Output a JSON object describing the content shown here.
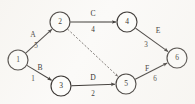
{
  "figure": {
    "kind": "directed-weighted-graph",
    "background_color": "#fbfaf8",
    "stroke_color": "#3a3633",
    "dashed_stroke_color": "#6b6662"
  },
  "nodes": [
    {
      "id": "1",
      "label": "1",
      "cx": 18,
      "cy": 60,
      "r": 10
    },
    {
      "id": "2",
      "label": "2",
      "cx": 60,
      "cy": 22,
      "r": 10
    },
    {
      "id": "3",
      "label": "3",
      "cx": 61,
      "cy": 86,
      "r": 10
    },
    {
      "id": "4",
      "label": "4",
      "cx": 127,
      "cy": 22,
      "r": 10
    },
    {
      "id": "5",
      "label": "5",
      "cx": 126,
      "cy": 84,
      "r": 10
    },
    {
      "id": "6",
      "label": "6",
      "cx": 177,
      "cy": 58,
      "r": 10
    }
  ],
  "edges": [
    {
      "id": "A",
      "from": "1",
      "to": "2",
      "name": "A",
      "weight": "5",
      "style": "solid",
      "name_x": 33,
      "name_y": 35,
      "weight_x": 36,
      "weight_y": 46
    },
    {
      "id": "B",
      "from": "1",
      "to": "3",
      "name": "B",
      "weight": "1",
      "style": "solid",
      "name_x": 40,
      "name_y": 68,
      "weight_x": 33,
      "weight_y": 79
    },
    {
      "id": "C",
      "from": "2",
      "to": "4",
      "name": "C",
      "weight": "4",
      "style": "solid",
      "name_x": 93,
      "name_y": 14,
      "weight_x": 93,
      "weight_y": 30
    },
    {
      "id": "D",
      "from": "3",
      "to": "5",
      "name": "D",
      "weight": "2",
      "style": "solid",
      "name_x": 93,
      "name_y": 78,
      "weight_x": 93,
      "weight_y": 94
    },
    {
      "id": "E",
      "from": "4",
      "to": "6",
      "name": "E",
      "weight": "3",
      "style": "solid",
      "name_x": 158,
      "name_y": 31,
      "weight_x": 146,
      "weight_y": 45
    },
    {
      "id": "F",
      "from": "5",
      "to": "6",
      "name": "F",
      "weight": "6",
      "style": "solid",
      "name_x": 147,
      "name_y": 69,
      "weight_x": 155,
      "weight_y": 79
    },
    {
      "id": "dummy-2-5",
      "from": "2",
      "to": "5",
      "name": "",
      "weight": "",
      "style": "dashed",
      "name_x": 0,
      "name_y": 0,
      "weight_x": 0,
      "weight_y": 0
    }
  ]
}
